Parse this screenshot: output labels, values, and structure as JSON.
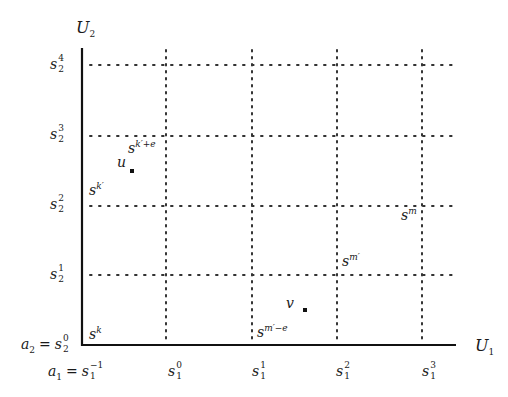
{
  "axes": {
    "y_axis_label": {
      "base": "U",
      "sub": "2"
    },
    "x_axis_label": {
      "base": "U",
      "sub": "1"
    }
  },
  "y_ticks": [
    {
      "base": "s",
      "sup": "4",
      "sub": "2"
    },
    {
      "base": "s",
      "sup": "3",
      "sub": "2"
    },
    {
      "base": "s",
      "sup": "2",
      "sub": "2"
    },
    {
      "base": "s",
      "sup": "1",
      "sub": "2"
    }
  ],
  "y_origin": {
    "lhs": "a",
    "lhs_sub": "2",
    "eq": "=",
    "base": "s",
    "sup": "0",
    "sub": "2"
  },
  "x_origin": {
    "lhs": "a",
    "lhs_sub": "1",
    "eq": "=",
    "base": "s",
    "sup": "−1",
    "sub": "1"
  },
  "x_ticks": [
    {
      "base": "s",
      "sup": "0",
      "sub": "1"
    },
    {
      "base": "s",
      "sup": "1",
      "sub": "1"
    },
    {
      "base": "s",
      "sup": "1",
      "sub": "1"
    },
    {
      "base": "s",
      "sup": "2",
      "sub": "1"
    },
    {
      "base": "s",
      "sup": "3",
      "sub": "1"
    }
  ],
  "points": [
    {
      "name": "u",
      "label": "u"
    },
    {
      "name": "v",
      "label": "v"
    }
  ],
  "state_labels": [
    {
      "base": "s",
      "sup": "k′+e"
    },
    {
      "base": "s",
      "sup": "k′"
    },
    {
      "base": "s",
      "sup": "k"
    },
    {
      "base": "s",
      "sup": "m"
    },
    {
      "base": "s",
      "sup": "m′"
    },
    {
      "base": "s",
      "sup": "m′−e"
    }
  ]
}
